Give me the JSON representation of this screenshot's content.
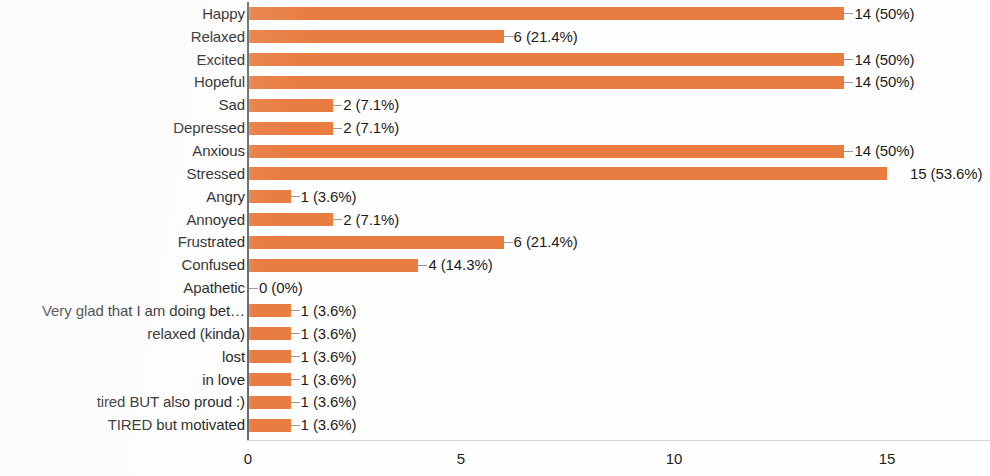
{
  "chart_data": {
    "type": "bar",
    "orientation": "horizontal",
    "title": "",
    "xlabel": "",
    "ylabel": "",
    "xlim": [
      0,
      17.4
    ],
    "xticks": [
      0,
      5,
      10,
      15
    ],
    "xtick_labels": [
      "0",
      "5",
      "10",
      "15"
    ],
    "grid": false,
    "legend": null,
    "bar_color": "#ef8043",
    "total_responses": 28,
    "categories": [
      "Happy",
      "Relaxed",
      "Excited",
      "Hopeful",
      "Sad",
      "Depressed",
      "Anxious",
      "Stressed",
      "Angry",
      "Annoyed",
      "Frustrated",
      "Confused",
      "Apathetic",
      "Very glad that I am doing bet…",
      "relaxed (kinda)",
      "lost",
      "in love",
      "tired BUT also proud :)",
      "TIRED but motivated"
    ],
    "values": [
      14,
      6,
      14,
      14,
      2,
      2,
      14,
      15,
      1,
      2,
      6,
      4,
      0,
      1,
      1,
      1,
      1,
      1,
      1
    ],
    "percents": [
      "50%",
      "21.4%",
      "50%",
      "50%",
      "7.1%",
      "7.1%",
      "50%",
      "53.6%",
      "3.6%",
      "7.1%",
      "21.4%",
      "14.3%",
      "0%",
      "3.6%",
      "3.6%",
      "3.6%",
      "3.6%",
      "3.6%",
      "3.6%"
    ],
    "data_labels": [
      "14 (50%)",
      "6 (21.4%)",
      "14 (50%)",
      "14 (50%)",
      "2 (7.1%)",
      "2 (7.1%)",
      "14 (50%)",
      "15 (53.6%)",
      "1 (3.6%)",
      "2 (7.1%)",
      "6 (21.4%)",
      "4 (14.3%)",
      "0 (0%)",
      "1 (3.6%)",
      "1 (3.6%)",
      "1 (3.6%)",
      "1 (3.6%)",
      "1 (3.6%)",
      "1 (3.6%)"
    ]
  }
}
